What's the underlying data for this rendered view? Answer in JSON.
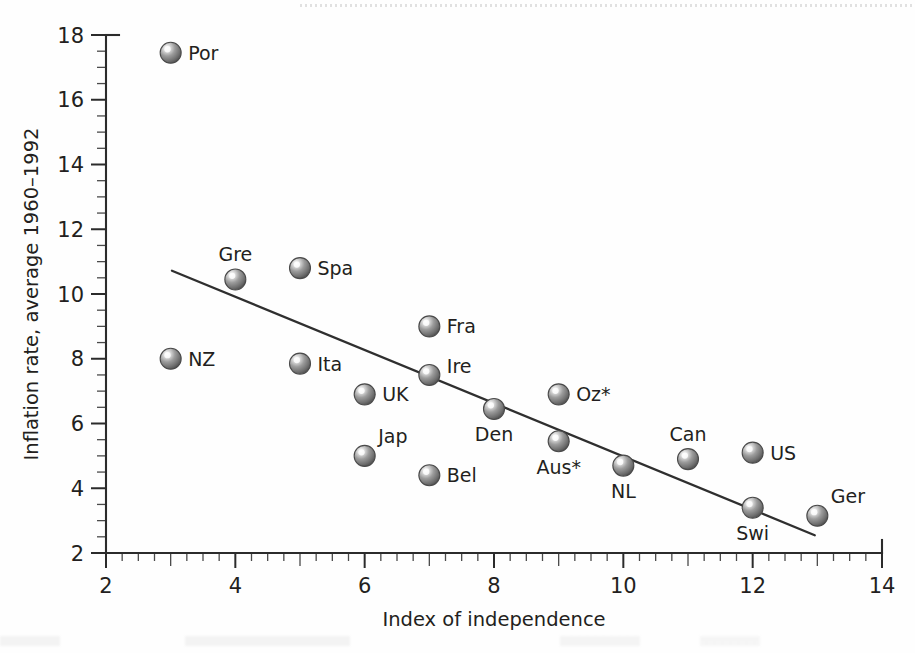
{
  "chart_data": {
    "type": "scatter",
    "title": "",
    "xlabel": "Index of independence",
    "ylabel": "Inflation rate, average 1960–1992",
    "xlim": [
      2,
      14
    ],
    "ylim": [
      2,
      18
    ],
    "x_major_ticks": [
      2,
      4,
      6,
      8,
      10,
      12,
      14
    ],
    "y_major_ticks": [
      2,
      4,
      6,
      8,
      10,
      12,
      14,
      16,
      18
    ],
    "x_minor_step": 0.25,
    "y_minor_step": 0.5,
    "grid": false,
    "legend": null,
    "points": [
      {
        "label": "Por",
        "x": 3,
        "y": 17.45,
        "label_pos": "right"
      },
      {
        "label": "Gre",
        "x": 4,
        "y": 10.45,
        "label_pos": "above"
      },
      {
        "label": "Spa",
        "x": 5,
        "y": 10.8,
        "label_pos": "right"
      },
      {
        "label": "Fra",
        "x": 7,
        "y": 9.0,
        "label_pos": "right"
      },
      {
        "label": "NZ",
        "x": 3,
        "y": 8.0,
        "label_pos": "right"
      },
      {
        "label": "Ita",
        "x": 5,
        "y": 7.85,
        "label_pos": "right"
      },
      {
        "label": "Ire",
        "x": 7,
        "y": 7.5,
        "label_pos": "right-up"
      },
      {
        "label": "UK",
        "x": 6,
        "y": 6.9,
        "label_pos": "right"
      },
      {
        "label": "Oz*",
        "x": 9,
        "y": 6.9,
        "label_pos": "right"
      },
      {
        "label": "Den",
        "x": 8,
        "y": 6.45,
        "label_pos": "below"
      },
      {
        "label": "Aus*",
        "x": 9,
        "y": 5.45,
        "label_pos": "below"
      },
      {
        "label": "Jap",
        "x": 6,
        "y": 5.0,
        "label_pos": "above-right"
      },
      {
        "label": "US",
        "x": 12,
        "y": 5.1,
        "label_pos": "right"
      },
      {
        "label": "Can",
        "x": 11,
        "y": 4.9,
        "label_pos": "above"
      },
      {
        "label": "NL",
        "x": 10,
        "y": 4.7,
        "label_pos": "below"
      },
      {
        "label": "Bel",
        "x": 7,
        "y": 4.4,
        "label_pos": "right"
      },
      {
        "label": "Swi",
        "x": 12,
        "y": 3.4,
        "label_pos": "below"
      },
      {
        "label": "Ger",
        "x": 13,
        "y": 3.15,
        "label_pos": "above-right"
      }
    ],
    "trendline": {
      "x1": 3.02,
      "y1": 10.72,
      "x2": 12.96,
      "y2": 2.55,
      "style": "solid"
    }
  },
  "colors": {
    "axis": "#2b2b2b",
    "text": "#231f20",
    "marker_body": "#8a8a8a",
    "marker_rim": "#4a4a4a",
    "marker_highlight": "#f2f2f2",
    "trendline": "#2f2f2f",
    "background": "#fefefe"
  }
}
